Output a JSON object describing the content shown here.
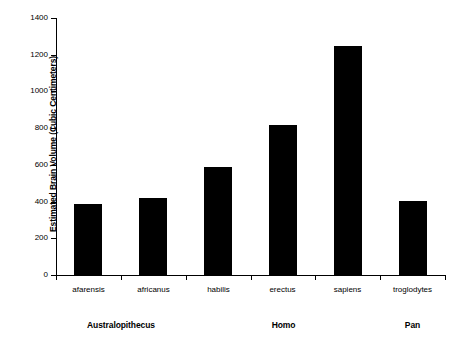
{
  "chart_data": {
    "type": "bar",
    "title": "",
    "xlabel": "",
    "ylabel": "Estimated Brain Volume (Cubic Centimeters)",
    "ylim": [
      0,
      1400
    ],
    "ytick_step": 200,
    "grid": false,
    "legend": "none",
    "bar_color": "#000000",
    "categories": [
      "afarensis",
      "africanus",
      "habilis",
      "erectus",
      "sapiens",
      "troglodytes"
    ],
    "values": [
      385,
      420,
      590,
      815,
      1245,
      405
    ],
    "ytick_labels": [
      "1400",
      "1200",
      "1000",
      "800",
      "600",
      "400",
      "200",
      "0"
    ],
    "ytick_values": [
      1400,
      1200,
      1000,
      800,
      600,
      400,
      200,
      0
    ],
    "groups": [
      {
        "label": "Australopithecus",
        "members": [
          "afarensis",
          "africanus"
        ]
      },
      {
        "label": "Homo",
        "members": [
          "habilis",
          "erectus",
          "sapiens"
        ]
      },
      {
        "label": "Pan",
        "members": [
          "troglodytes"
        ]
      }
    ]
  },
  "axis": {
    "y_title": "Estimated Brain Volume (Cubic Centimeters)",
    "ticks": [
      {
        "label": "1400",
        "value": 1400
      },
      {
        "label": "1200",
        "value": 1200
      },
      {
        "label": "1000",
        "value": 1000
      },
      {
        "label": "800",
        "value": 800
      },
      {
        "label": "600",
        "value": 600
      },
      {
        "label": "400",
        "value": 400
      },
      {
        "label": "200",
        "value": 200
      },
      {
        "label": "0",
        "value": 0
      }
    ]
  },
  "bars": [
    {
      "name": "afarensis",
      "label": "afarensis",
      "value": 385
    },
    {
      "name": "africanus",
      "label": "africanus",
      "value": 420
    },
    {
      "name": "habilis",
      "label": "habilis",
      "value": 590
    },
    {
      "name": "erectus",
      "label": "erectus",
      "value": 815
    },
    {
      "name": "sapiens",
      "label": "sapiens",
      "value": 1245
    },
    {
      "name": "troglodytes",
      "label": "troglodytes",
      "value": 405
    }
  ],
  "groups": [
    {
      "label": "Australopithecus"
    },
    {
      "label": "Homo"
    },
    {
      "label": "Pan"
    }
  ],
  "footer": {
    "clipped_caption": ""
  }
}
